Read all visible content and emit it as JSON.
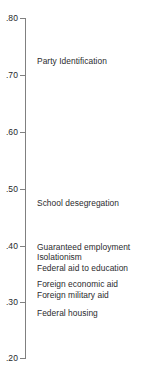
{
  "chart_data": {
    "type": "scatter",
    "title": "",
    "subtitle": "",
    "xlabel": "",
    "ylabel": "",
    "orientation": "vertical-axis-only",
    "grid": false,
    "legend": null,
    "ylim": [
      0.2,
      0.8
    ],
    "ytick_step": 0.1,
    "ytick_labels": [
      ".80",
      ".70",
      ".60",
      ".50",
      ".40",
      ".30",
      ".20"
    ],
    "ytick_values": [
      0.8,
      0.7,
      0.6,
      0.5,
      0.4,
      0.3,
      0.2
    ],
    "axis_color": "#808080",
    "text_color": "#2a2b2e",
    "categories": [
      "Party Identification",
      "School desegregation",
      "Guaranteed employment",
      "Isolationism",
      "Federal aid to education",
      "Foreign economic aid",
      "Foreign military aid",
      "Federal housing"
    ],
    "values": [
      0.723,
      0.472,
      0.394,
      0.376,
      0.357,
      0.329,
      0.31,
      0.278
    ],
    "annotations": [
      {
        "label": "Party Identification",
        "value": 0.723
      },
      {
        "label": "School desegregation",
        "value": 0.472
      },
      {
        "label": "Guaranteed employment",
        "value": 0.394
      },
      {
        "label": "Isolationism",
        "value": 0.376
      },
      {
        "label": "Federal aid to education",
        "value": 0.357
      },
      {
        "label": "Foreign economic aid",
        "value": 0.329
      },
      {
        "label": "Foreign military aid",
        "value": 0.31
      },
      {
        "label": "Federal housing",
        "value": 0.278
      }
    ]
  },
  "axis": {
    "ticks": [
      {
        "label": ".80",
        "top": 18
      },
      {
        "label": ".70",
        "top": 75
      },
      {
        "label": ".60",
        "top": 132
      },
      {
        "label": ".50",
        "top": 189
      },
      {
        "label": ".40",
        "top": 246
      },
      {
        "label": ".30",
        "top": 302
      },
      {
        "label": ".20",
        "top": 358
      }
    ]
  },
  "labels": [
    {
      "text": "Party Identification",
      "top": 57
    },
    {
      "text": "School desegregation",
      "top": 199
    },
    {
      "text": "Guaranteed employment",
      "top": 243
    },
    {
      "text": "Isolationism",
      "top": 253
    },
    {
      "text": "Federal aid to education",
      "top": 264
    },
    {
      "text": "Foreign economic aid",
      "top": 280
    },
    {
      "text": "Foreign military aid",
      "top": 291
    },
    {
      "text": "Federal housing",
      "top": 309
    }
  ]
}
